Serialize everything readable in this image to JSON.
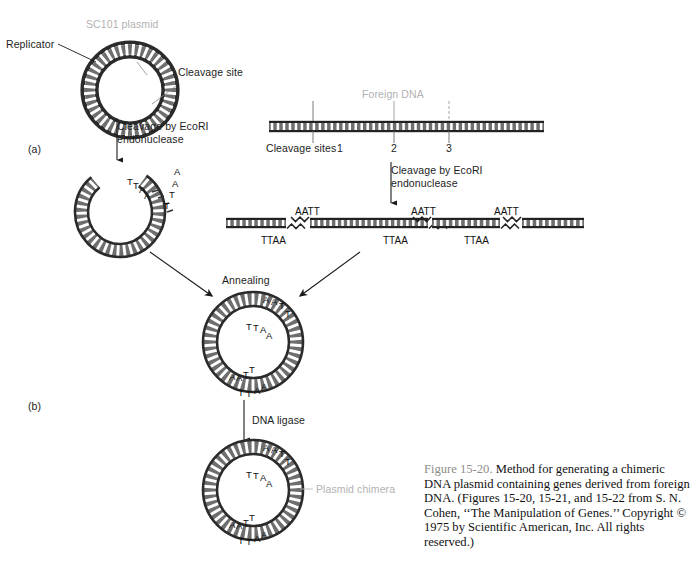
{
  "figure": {
    "panels": [
      {
        "id": "a",
        "label": "(a)"
      },
      {
        "id": "b",
        "label": "(b)"
      }
    ],
    "labels": {
      "plasmid_title": "SC101 plasmid",
      "replicator": "Replicator",
      "cleavage_site": "Cleavage site",
      "foreign_dna": "Foreign DNA",
      "cleavage_sites": "Cleavage sites",
      "site_1": "1",
      "site_2": "2",
      "site_3": "3",
      "annealing": "Annealing",
      "dna_ligase": "DNA ligase",
      "plasmid_chimera": "Plasmid chimera"
    },
    "steps": {
      "cleavage_plasmid_line1": "Cleavage by EcoRI",
      "cleavage_plasmid_line2": "endonuclease",
      "cleavage_foreign_line1": "Cleavage by EcoRI",
      "cleavage_foreign_line2": "endonuclease"
    },
    "sticky_ends": {
      "top_strand": "AATT",
      "bottom_strand": "TTAA"
    },
    "fragment_ends": [
      {
        "bottom": "TTAA"
      },
      {
        "top": "AATT",
        "bottom": "TTAA"
      },
      {
        "top": "AATT",
        "bottom": "TTAA"
      },
      {
        "top": "AATT"
      }
    ],
    "cut_plasmid_bases": {
      "upper_t": "T",
      "upper_t2": "T",
      "upper_a": "A",
      "upper_a2": "A",
      "lower_a": "A",
      "lower_a2": "A",
      "lower_t": "T",
      "lower_t2": "T"
    }
  },
  "caption": {
    "figure_number": "Figure 15-20.",
    "text": " Method for generating a chimeric DNA plasmid containing genes derived from foreign DNA. (Figures 15-20, 15-21, and 15-22 from S. N. Cohen, ‘‘The Manipulation of Genes.’’ Copyright © 1975 by Scientific American, Inc. All rights reserved.)"
  },
  "colors": {
    "ink": "#1a1a1a",
    "gray_label": "#b2b2b2",
    "caption_figno": "#8d8d8d",
    "dna_fill": "#6e6e6e"
  }
}
